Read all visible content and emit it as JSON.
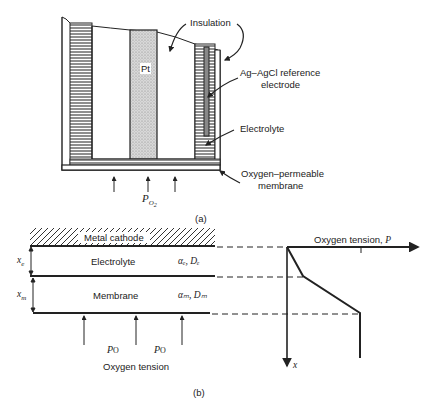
{
  "figure_a": {
    "labels": {
      "insulation": "Insulation",
      "pt": "Pt",
      "reference_line1": "Ag–AgCl reference",
      "reference_line2": "electrode",
      "electrolyte": "Electrolyte",
      "membrane_line1": "Oxygen–permeable",
      "membrane_line2": "membrane",
      "po2_main": "P",
      "po2_sub": "O",
      "po2_subsub": "2",
      "caption": "(a)"
    }
  },
  "figure_b": {
    "labels": {
      "metal_cathode": "Metal cathode",
      "electrolyte": "Electrolyte",
      "membrane": "Membrane",
      "xe": "x",
      "xe_sub": "e",
      "xm": "x",
      "xm_sub": "m",
      "electrolyte_props": "αₑ, Dₑ",
      "membrane_props": "αₘ, Dₘ",
      "po_left": "P",
      "po_left_sub": "O",
      "po_right": "P",
      "po_right_sub": "O",
      "oxygen_tension": "Oxygen tension",
      "axis_p_label": "Oxygen tension, ",
      "axis_p_var": "P",
      "axis_x_var": "x",
      "caption": "(b)"
    }
  }
}
